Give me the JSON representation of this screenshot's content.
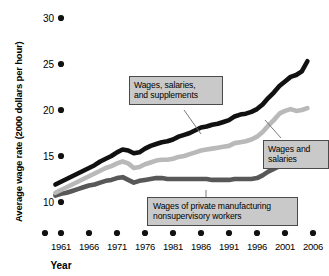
{
  "chart_data": {
    "type": "line",
    "title": "",
    "xlabel": "Year",
    "ylabel": "Average wage rate (2000 dollars per hour)",
    "xlim": [
      1959,
      2006
    ],
    "ylim": [
      8.2,
      30
    ],
    "grid": false,
    "legend_position": "inline-callout-boxes",
    "xticks": [
      1961,
      1966,
      1971,
      1976,
      1981,
      1986,
      1991,
      1996,
      2001,
      2006
    ],
    "xtick_labels": [
      "1961",
      "1966",
      "1971",
      "1976",
      "1981",
      "1986",
      "1991",
      "1996",
      "2001",
      "2006"
    ],
    "yticks": [
      10,
      15,
      20,
      25,
      30
    ],
    "ytick_labels": [
      "10",
      "15",
      "20",
      "25",
      "30"
    ],
    "x": [
      1960,
      1961,
      1962,
      1963,
      1964,
      1965,
      1966,
      1967,
      1968,
      1969,
      1970,
      1971,
      1972,
      1973,
      1974,
      1975,
      1976,
      1977,
      1978,
      1979,
      1980,
      1981,
      1982,
      1983,
      1984,
      1985,
      1986,
      1987,
      1988,
      1989,
      1990,
      1991,
      1992,
      1993,
      1994,
      1995,
      1996,
      1997,
      1998,
      1999,
      2000,
      2001,
      2002,
      2003,
      2004,
      2005
    ],
    "series": [
      {
        "name": "Wages, salaries, and supplements",
        "color": "#111111",
        "values": [
          11.9,
          12.2,
          12.5,
          12.8,
          13.1,
          13.4,
          13.7,
          14.0,
          14.4,
          14.7,
          15.0,
          15.4,
          15.7,
          15.6,
          15.3,
          15.4,
          15.8,
          16.1,
          16.3,
          16.5,
          16.6,
          16.8,
          17.1,
          17.3,
          17.5,
          17.8,
          18.1,
          18.2,
          18.4,
          18.5,
          18.7,
          18.9,
          19.3,
          19.5,
          19.6,
          19.8,
          20.1,
          20.6,
          21.3,
          21.9,
          22.6,
          23.1,
          23.6,
          23.8,
          24.2,
          25.3
        ]
      },
      {
        "name": "Wages and salaries",
        "color": "#b9b9b9",
        "values": [
          11.0,
          11.3,
          11.6,
          11.9,
          12.2,
          12.5,
          12.8,
          13.1,
          13.4,
          13.7,
          13.9,
          14.2,
          14.4,
          14.2,
          13.7,
          13.8,
          14.1,
          14.3,
          14.5,
          14.6,
          14.6,
          14.7,
          14.9,
          15.0,
          15.2,
          15.4,
          15.6,
          15.7,
          15.8,
          15.9,
          16.0,
          16.1,
          16.4,
          16.5,
          16.6,
          16.8,
          17.1,
          17.6,
          18.3,
          18.9,
          19.6,
          19.9,
          20.1,
          19.9,
          20.0,
          20.2
        ]
      },
      {
        "name": "Wages of private manufacturing nonsupervisory workers",
        "color": "#585858",
        "values": [
          10.7,
          10.9,
          11.0,
          11.2,
          11.4,
          11.6,
          11.8,
          11.9,
          12.1,
          12.3,
          12.4,
          12.6,
          12.7,
          12.4,
          12.1,
          12.3,
          12.4,
          12.5,
          12.6,
          12.6,
          12.5,
          12.5,
          12.5,
          12.5,
          12.5,
          12.5,
          12.5,
          12.5,
          12.4,
          12.4,
          12.4,
          12.4,
          12.5,
          12.5,
          12.5,
          12.5,
          12.6,
          12.9,
          13.3,
          13.6,
          13.9,
          14.1,
          14.3,
          14.4,
          14.4,
          14.4
        ]
      }
    ],
    "annotations": [
      {
        "id": "callout-supplements",
        "lines": [
          "Wages, salaries,",
          "and supplements"
        ],
        "target_series": "Wages, salaries, and supplements"
      },
      {
        "id": "callout-wages-salaries",
        "lines": [
          "Wages and",
          "salaries"
        ],
        "target_series": "Wages and salaries"
      },
      {
        "id": "callout-manufacturing",
        "lines": [
          "Wages of private manufacturing",
          "nonsupervisory workers"
        ],
        "target_series": "Wages of private manufacturing nonsupervisory workers"
      }
    ]
  },
  "axis": {
    "y_title": "Average wage rate (2000 dollars per hour)",
    "x_title": "Year",
    "ytick_0": "10",
    "ytick_1": "15",
    "ytick_2": "20",
    "ytick_3": "25",
    "ytick_4": "30",
    "xtick_0": "1961",
    "xtick_1": "1966",
    "xtick_2": "1971",
    "xtick_3": "1976",
    "xtick_4": "1981",
    "xtick_5": "1986",
    "xtick_6": "1991",
    "xtick_7": "1996",
    "xtick_8": "2001",
    "xtick_9": "2006"
  },
  "callouts": {
    "supplements_line1": "Wages, salaries,",
    "supplements_line2": "and supplements",
    "wages_line1": "Wages and",
    "wages_line2": "salaries",
    "manufacturing_line1": "Wages of private manufacturing",
    "manufacturing_line2": "nonsupervisory workers"
  },
  "colors": {
    "series_supplements": "#111111",
    "series_wages": "#b9b9b9",
    "series_manufacturing": "#585858",
    "callout_fill": "#c9c9c9",
    "callout_border": "#4a4a4a",
    "background": "#ffffff"
  }
}
